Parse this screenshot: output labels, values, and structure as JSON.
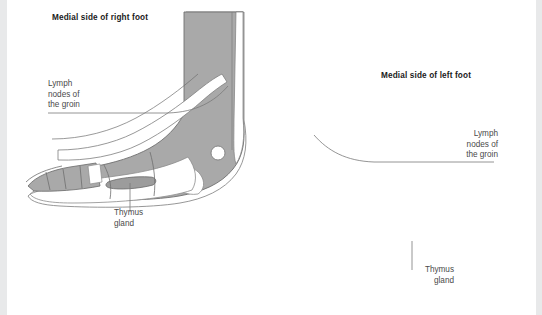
{
  "figure": {
    "kind": "reflexology-foot-diagram",
    "background_color": "#ffffff",
    "edge_band_color": "#e8e9ea",
    "foot_fill_color": "#a9a9a9",
    "foot_outline_color": "#6f6f6f",
    "zone_band_color": "#ffffff",
    "label_text_color": "#4a4a4a",
    "caption_text_color": "#1b1b1b",
    "leader_line_color": "#7a7a7a"
  },
  "right_foot": {
    "caption": "Medial side of right foot",
    "labels": {
      "lymph": "Lymph\nnodes of\nthe groin",
      "lymph_line1": "Lymph",
      "lymph_line2": "nodes of",
      "lymph_line3": "the groin",
      "thymus_line1": "Thymus",
      "thymus_line2": "gland"
    }
  },
  "left_foot": {
    "caption": "Medial side of left foot",
    "labels": {
      "lymph_line1": "Lymph",
      "lymph_line2": "nodes of",
      "lymph_line3": "the groin",
      "thymus_line1": "Thymus",
      "thymus_line2": "gland"
    }
  }
}
